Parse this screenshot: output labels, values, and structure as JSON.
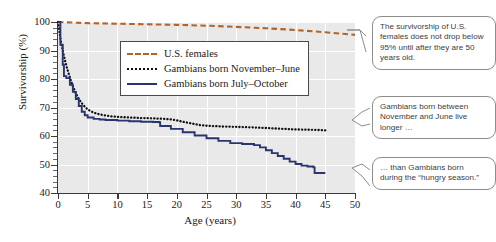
{
  "chart_data": {
    "type": "line",
    "title": "",
    "xlabel": "Age (years)",
    "ylabel": "Survivorship (%)",
    "xlim": [
      0,
      50
    ],
    "ylim": [
      40,
      100
    ],
    "xticks": [
      0,
      5,
      10,
      15,
      20,
      25,
      30,
      35,
      40,
      45,
      50
    ],
    "yticks": [
      40,
      50,
      60,
      70,
      80,
      90,
      100
    ],
    "grid": true,
    "legend_position": "upper-center-inside",
    "series": [
      {
        "name": "U.S. females",
        "style": "dashed",
        "color": "#b4642a",
        "x": [
          0,
          5,
          10,
          15,
          20,
          25,
          30,
          35,
          40,
          45,
          50
        ],
        "y": [
          100,
          99.6,
          99.4,
          99.2,
          99.0,
          98.7,
          98.3,
          97.8,
          97.2,
          96.4,
          95.5
        ]
      },
      {
        "name": "Gambians born November–June",
        "style": "dotted",
        "color": "#111111",
        "x": [
          0,
          0.5,
          1,
          1.5,
          2,
          2.5,
          3,
          3.5,
          4,
          4.5,
          5,
          6,
          7,
          8,
          9,
          10,
          12,
          14,
          16,
          17,
          18,
          19,
          20,
          21,
          22,
          23,
          24,
          25,
          28,
          30,
          33,
          35,
          38,
          40,
          42,
          44,
          45
        ],
        "y": [
          100,
          93,
          88,
          84,
          80.5,
          77.5,
          75,
          73,
          71.5,
          70.3,
          69.3,
          68.2,
          67.6,
          67.2,
          66.9,
          66.7,
          66.5,
          66.3,
          66.2,
          66.1,
          66.0,
          65.8,
          65.5,
          65.0,
          64.6,
          64.2,
          63.8,
          63.6,
          63.3,
          63.2,
          63.0,
          62.8,
          62.5,
          62.3,
          62.2,
          62.1,
          62.0
        ]
      },
      {
        "name": "Gambians born July–October",
        "style": "solid",
        "color": "#2a3570",
        "x": [
          0,
          0.4,
          0.8,
          1,
          1.4,
          2,
          2.5,
          3,
          3.5,
          4,
          4.5,
          5,
          6,
          7,
          8,
          10,
          12,
          14,
          16,
          17,
          17.2,
          19,
          21,
          23,
          25,
          27,
          29,
          31,
          33,
          34,
          35,
          36,
          37,
          38,
          39,
          40,
          41,
          42,
          43,
          43.2,
          45
        ],
        "y": [
          100,
          92,
          85,
          81,
          80.3,
          78,
          75.5,
          73,
          70.5,
          68.5,
          67.3,
          66.5,
          66.0,
          65.8,
          65.6,
          65.4,
          65.2,
          65.0,
          64.9,
          64.8,
          63.5,
          62.5,
          61.3,
          60.2,
          59.2,
          58.3,
          57.5,
          57.2,
          56.8,
          56.0,
          55.0,
          54.0,
          53.0,
          52.0,
          51.0,
          50.2,
          49.6,
          49.3,
          49.0,
          47.0,
          47.0
        ]
      }
    ],
    "annotations": [
      {
        "id": "us-females-note",
        "text": "The survivorship of U.S. females does not drop below 95% until after they are 50 years old.",
        "points_to": "U.S. females"
      },
      {
        "id": "nov-june-note",
        "text": "Gambians born between November and June live longer …",
        "points_to": "Gambians born November–June"
      },
      {
        "id": "hungry-season-note",
        "text": "… than Gambians born during the “hungry season.”",
        "points_to": "Gambians born July–October"
      }
    ]
  },
  "axes": {
    "y_title": "Survivorship (%)",
    "x_title": "Age (years)",
    "y_tick_labels": [
      "100",
      "90",
      "80",
      "70",
      "60",
      "50",
      "40"
    ],
    "x_tick_labels": [
      "0",
      "5",
      "10",
      "15",
      "20",
      "25",
      "30",
      "35",
      "40",
      "45",
      "50"
    ]
  },
  "legend": {
    "items": [
      {
        "label": "U.S. females",
        "key": "dashed-line-key",
        "color": "#b4642a"
      },
      {
        "label": "Gambians born November–June",
        "key": "dotted-line-key",
        "color": "#111111"
      },
      {
        "label": "Gambians born July–October",
        "key": "solid-line-key",
        "color": "#2a3570"
      }
    ]
  },
  "callouts": {
    "us_females": "The survivorship of U.S. females does not drop below 95% until after they are 50 years old.",
    "nov_june": "Gambians born between November and June live longer …",
    "hungry_season": "… than Gambians born during the “hungry season.”"
  }
}
